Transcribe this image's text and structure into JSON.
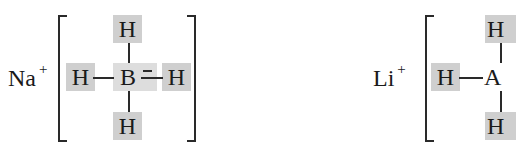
{
  "structures": [
    {
      "name": "sodium-borohydride",
      "cation": {
        "symbol": "Na",
        "charge": "+"
      },
      "center": "B",
      "ligands": {
        "top": "H",
        "left": "H",
        "right": "H",
        "bottom": "H"
      }
    },
    {
      "name": "lithium-aluminum-hydride",
      "cation": {
        "symbol": "Li",
        "charge": "+"
      },
      "center": "A",
      "ligands": {
        "top": "H",
        "left": "H",
        "bottom": "H"
      }
    }
  ],
  "colors": {
    "hydrogen_highlight": "#cfcfcf",
    "center_highlight": "#dddddd",
    "ink": "#1a1a1a"
  }
}
